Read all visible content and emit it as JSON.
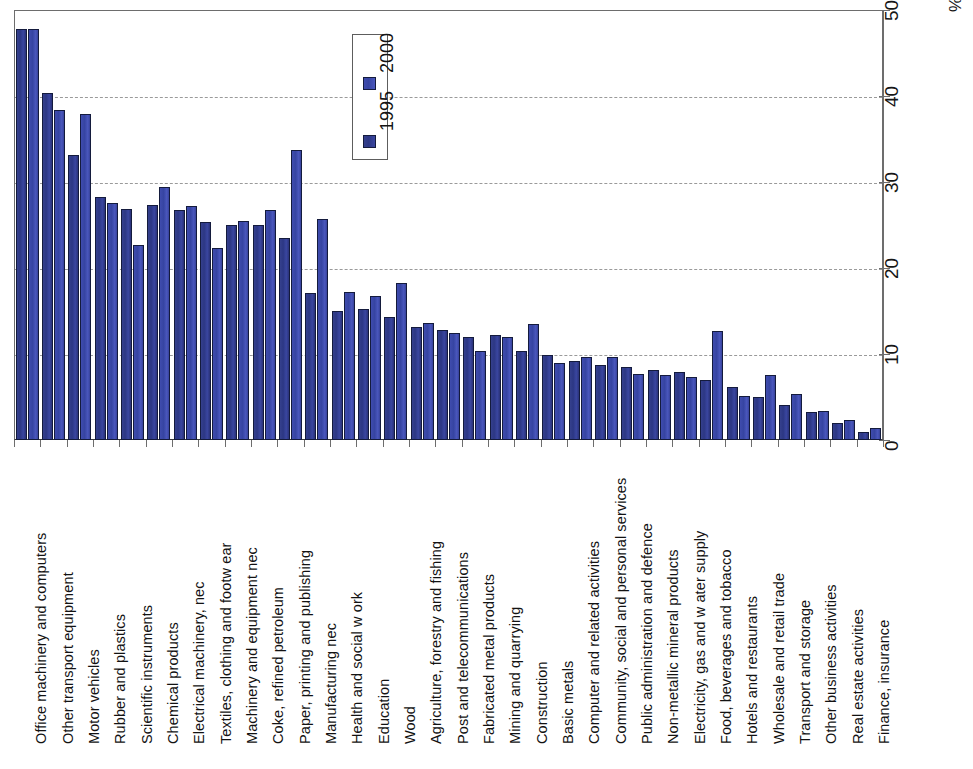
{
  "chart_data": {
    "type": "bar",
    "title": "",
    "xlabel": "",
    "ylabel": "%",
    "ylim": [
      0,
      50
    ],
    "yticks": [
      0,
      10,
      20,
      30,
      40,
      50
    ],
    "grid": true,
    "legend_position": "top-center",
    "categories": [
      "Office machinery and computers",
      "Other transport equipment",
      "Motor vehicles",
      "Rubber and plastics",
      "Scientific instruments",
      "Chemical products",
      "Electrical machinery, nec",
      "Textiles, clothing and footw ear",
      "Machinery and equipment nec",
      "Coke, refined petroleum",
      "Paper, printing and publishing",
      "Manufacturing nec",
      "Health and social w ork",
      "Education",
      "Wood",
      "Agriculture, forestry and fishing",
      "Post and telecommunications",
      "Fabricated metal products",
      "Mining and quarrying",
      "Construction",
      "Basic metals",
      "Computer and related activities",
      "Community, social and personal services",
      "Public administration and defence",
      "Non-metallic mineral products",
      "Electricity, gas and w ater supply",
      "Food, beverages and tobacco",
      "Hotels and restaurants",
      "Wholesale and retail trade",
      "Transport and storage",
      "Other business activities",
      "Real estate activities",
      "Finance, insurance"
    ],
    "series": [
      {
        "name": "1995",
        "color": "#2c3784",
        "values": [
          47.8,
          40.3,
          33.1,
          28.2,
          26.9,
          27.3,
          26.8,
          25.4,
          25.0,
          25.0,
          23.5,
          17.1,
          15.0,
          15.2,
          14.3,
          13.1,
          12.8,
          12.0,
          12.2,
          10.4,
          9.9,
          9.2,
          8.7,
          8.5,
          8.1,
          7.9,
          7.0,
          6.2,
          5.0,
          4.1,
          3.2,
          2.0,
          0.9
        ]
      },
      {
        "name": "2000",
        "color": "#3644a2",
        "values": [
          47.8,
          38.4,
          37.9,
          27.6,
          22.7,
          29.4,
          27.2,
          22.3,
          25.5,
          26.8,
          33.7,
          25.7,
          17.2,
          16.8,
          18.2,
          13.6,
          12.4,
          10.3,
          12.0,
          13.5,
          8.9,
          9.6,
          9.6,
          7.7,
          7.6,
          7.3,
          12.7,
          5.1,
          7.6,
          5.3,
          3.4,
          2.3,
          1.4
        ]
      }
    ]
  },
  "legend": {
    "entries": [
      {
        "label": "2000",
        "swatch": "legend-swatch-2000"
      },
      {
        "label": "1995",
        "swatch": "legend-swatch-1995"
      }
    ]
  },
  "axis": {
    "y_title": "%",
    "tick_labels": [
      "0",
      "10",
      "20",
      "30",
      "40",
      "50"
    ]
  }
}
